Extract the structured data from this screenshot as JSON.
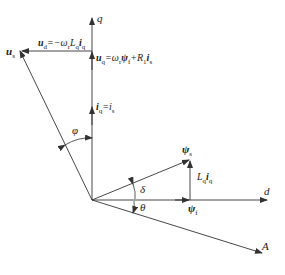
{
  "diagram": {
    "type": "phasor-vector-diagram",
    "colors": {
      "line": "#333333",
      "background": "#ffffff"
    },
    "axes": {
      "q": {
        "label": "q"
      },
      "d": {
        "label": "d"
      },
      "A": {
        "label": "A"
      }
    },
    "vectors": {
      "u_s": {
        "label": "u",
        "sub": "s"
      },
      "u_d": {
        "label": "u",
        "sub": "d",
        "eq": "=−ω",
        "eq_sub": "r",
        "rest": "L",
        "rest_sub": "q",
        "tail": "i",
        "tail_sub": "q"
      },
      "u_q": {
        "label": "u",
        "sub": "q",
        "eq": "=ω",
        "eq_sub": "r",
        "psi": "ψ",
        "psi_sub": "f",
        "plus": "+R",
        "plus_sub": "1",
        "tail": "i",
        "tail_sub": "s"
      },
      "i_q": {
        "label": "i",
        "sub": "q",
        "eq": "=i",
        "eq_sub": "s"
      },
      "psi_s": {
        "label": "ψ",
        "sub": "s"
      },
      "psi_f": {
        "label": "ψ",
        "sub": "f"
      },
      "Lq_iq": {
        "label": "L",
        "sub": "q",
        "tail": "i",
        "tail_sub": "q"
      }
    },
    "angles": {
      "phi": "φ",
      "delta": "δ",
      "theta": "θ"
    }
  }
}
